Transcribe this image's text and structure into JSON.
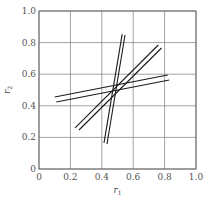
{
  "chart_data": {
    "type": "line",
    "title": "",
    "xlabel": "r1",
    "ylabel": "r2",
    "xlim": [
      0,
      1.0
    ],
    "ylim": [
      0,
      1.0
    ],
    "grid": true,
    "legend": null,
    "x_ticks": [
      "0",
      "0.2",
      "0.4",
      "0.6",
      "0.8",
      "1.0"
    ],
    "y_ticks": [
      "0",
      "0.2",
      "0.4",
      "0.6",
      "0.8",
      "1.0"
    ],
    "series": [
      {
        "name": "line-1",
        "x": [
          0.1,
          0.82
        ],
        "y": [
          0.456,
          0.595
        ]
      },
      {
        "name": "line-2",
        "x": [
          0.11,
          0.83
        ],
        "y": [
          0.424,
          0.563
        ]
      },
      {
        "name": "line-3",
        "x": [
          0.23,
          0.76
        ],
        "y": [
          0.26,
          0.785
        ]
      },
      {
        "name": "line-4",
        "x": [
          0.255,
          0.78
        ],
        "y": [
          0.247,
          0.766
        ]
      },
      {
        "name": "line-5",
        "x": [
          0.414,
          0.53
        ],
        "y": [
          0.165,
          0.854
        ]
      },
      {
        "name": "line-6",
        "x": [
          0.433,
          0.548
        ],
        "y": [
          0.158,
          0.848
        ]
      }
    ],
    "colors": {
      "line": "#1a1a1a",
      "grid": "#8a8a8a",
      "frame": "#6a6a6a"
    }
  }
}
